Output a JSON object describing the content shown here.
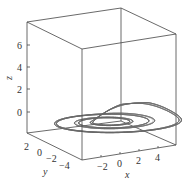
{
  "chart_data": {
    "type": "line",
    "projection": "3d",
    "title": "",
    "xlabel": "x",
    "ylabel": "y",
    "zlabel": "z",
    "x_ticks": [
      "-2",
      "0",
      "2",
      "4"
    ],
    "y_ticks": [
      "2",
      "0",
      "-2",
      "-4"
    ],
    "z_ticks": [
      "0",
      "2",
      "4",
      "6"
    ],
    "xlim": [
      -4,
      6
    ],
    "ylim": [
      -5,
      3
    ],
    "zlim": [
      -1,
      7.5
    ],
    "grid": false,
    "legend": null,
    "line_color": "#6a6a6a",
    "box_color": "#444444"
  },
  "labels": {
    "x": "x",
    "y": "y",
    "z": "z",
    "xt0": "−2",
    "xt1": "0",
    "xt2": "2",
    "xt3": "4",
    "yt0": "2",
    "yt1": "0",
    "yt2": "−2",
    "yt3": "−4",
    "zt0": "0",
    "zt1": "2",
    "zt2": "4",
    "zt3": "6"
  }
}
